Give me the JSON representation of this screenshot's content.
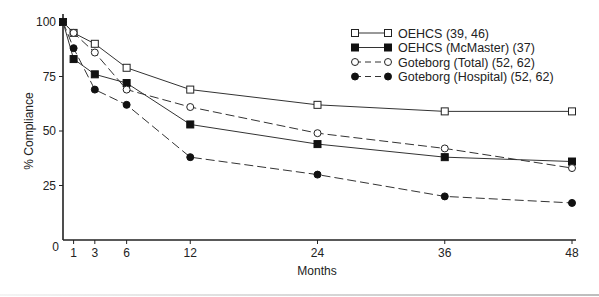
{
  "chart_data": {
    "type": "line",
    "title": "",
    "xlabel": "Months",
    "ylabel": "% Compliance",
    "x": [
      0,
      1,
      3,
      6,
      12,
      24,
      36,
      48
    ],
    "x_ticks": [
      "0",
      "1",
      "3",
      "6",
      "12",
      "24",
      "36",
      "48"
    ],
    "y_ticks": [
      "25",
      "50",
      "75",
      "100"
    ],
    "xlim": [
      0,
      48
    ],
    "ylim": [
      0,
      100
    ],
    "grid": false,
    "legend_position": "top-right",
    "series": [
      {
        "name": "OEHCS (39, 46)",
        "marker": "open-square",
        "line": "solid",
        "values": [
          100,
          95,
          90,
          79,
          69,
          62,
          59,
          59
        ]
      },
      {
        "name": "OEHCS (McMaster) (37)",
        "marker": "filled-square",
        "line": "solid",
        "values": [
          100,
          83,
          76,
          72,
          53,
          44,
          38,
          36
        ]
      },
      {
        "name": "Goteborg (Total) (52, 62)",
        "marker": "open-circle",
        "line": "dashed",
        "values": [
          100,
          95,
          86,
          69,
          61,
          49,
          42,
          33
        ]
      },
      {
        "name": "Goteborg (Hospital) (52, 62)",
        "marker": "filled-circle",
        "line": "dashed",
        "values": [
          100,
          88,
          69,
          62,
          38,
          30,
          20,
          17
        ]
      }
    ]
  }
}
